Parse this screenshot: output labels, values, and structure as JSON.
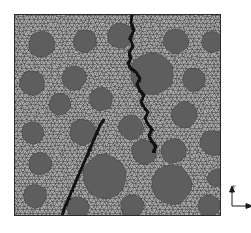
{
  "figure": {
    "panel": {
      "x": 14,
      "y": 14,
      "width": 207,
      "height": 202
    },
    "background_color": "#ffffff"
  },
  "mesh": {
    "name": "triangular-finite-element-mesh",
    "matrix_fill": "#a7a7a7",
    "mesh_line_color": "#3a3a3a",
    "mesh_line_width": 0.45,
    "cell_size": 4.3,
    "border_color": "#2b2b2b",
    "border_width": 1.0
  },
  "inclusions": {
    "name": "aggregate-inclusions",
    "fill": "#5e5e5e",
    "stroke": "#3a3a3a",
    "stroke_width": 0.5,
    "count": 26,
    "items": [
      {
        "cx": 42,
        "cy": 44,
        "r": 13.5,
        "sides": 13
      },
      {
        "cx": 85,
        "cy": 41,
        "r": 11.5,
        "sides": 12
      },
      {
        "cx": 120,
        "cy": 36,
        "r": 13.0,
        "sides": 13
      },
      {
        "cx": 176,
        "cy": 41,
        "r": 12.5,
        "sides": 13
      },
      {
        "cx": 212,
        "cy": 42,
        "r": 11.0,
        "sides": 12
      },
      {
        "cx": 32,
        "cy": 83,
        "r": 12.5,
        "sides": 13
      },
      {
        "cx": 74,
        "cy": 78,
        "r": 12.5,
        "sides": 13
      },
      {
        "cx": 152,
        "cy": 74,
        "r": 22.0,
        "sides": 15
      },
      {
        "cx": 194,
        "cy": 80,
        "r": 12.0,
        "sides": 12
      },
      {
        "cx": 60,
        "cy": 104,
        "r": 11.0,
        "sides": 12
      },
      {
        "cx": 101,
        "cy": 99,
        "r": 12.0,
        "sides": 12
      },
      {
        "cx": 184,
        "cy": 115,
        "r": 13.0,
        "sides": 13
      },
      {
        "cx": 33,
        "cy": 133,
        "r": 11.5,
        "sides": 12
      },
      {
        "cx": 83,
        "cy": 132,
        "r": 13.0,
        "sides": 13
      },
      {
        "cx": 131,
        "cy": 127,
        "r": 12.5,
        "sides": 13
      },
      {
        "cx": 213,
        "cy": 143,
        "r": 13.0,
        "sides": 13
      },
      {
        "cx": 144,
        "cy": 152,
        "r": 12.5,
        "sides": 12
      },
      {
        "cx": 174,
        "cy": 151,
        "r": 12.5,
        "sides": 12
      },
      {
        "cx": 40,
        "cy": 164,
        "r": 11.5,
        "sides": 12
      },
      {
        "cx": 104,
        "cy": 176,
        "r": 22.0,
        "sides": 15
      },
      {
        "cx": 172,
        "cy": 185,
        "r": 20.0,
        "sides": 14
      },
      {
        "cx": 35,
        "cy": 196,
        "r": 12.0,
        "sides": 12
      },
      {
        "cx": 78,
        "cy": 208,
        "r": 11.5,
        "sides": 12
      },
      {
        "cx": 132,
        "cy": 206,
        "r": 11.5,
        "sides": 12
      },
      {
        "cx": 209,
        "cy": 206,
        "r": 11.5,
        "sides": 12
      },
      {
        "cx": 216,
        "cy": 178,
        "r": 9.0,
        "sides": 11
      }
    ]
  },
  "cracks": {
    "name": "crack-paths",
    "color": "#121212",
    "width": 2.6,
    "paths": [
      {
        "label": "upper-crack-path",
        "points": [
          [
            132,
            14
          ],
          [
            131,
            22
          ],
          [
            134,
            30
          ],
          [
            130,
            38
          ],
          [
            133,
            46
          ],
          [
            129,
            52
          ],
          [
            131,
            58
          ],
          [
            128,
            63
          ],
          [
            131,
            68
          ],
          [
            136,
            72
          ],
          [
            140,
            78
          ],
          [
            137,
            84
          ],
          [
            140,
            90
          ],
          [
            144,
            95
          ],
          [
            141,
            101
          ],
          [
            144,
            107
          ],
          [
            148,
            112
          ],
          [
            145,
            118
          ],
          [
            148,
            124
          ],
          [
            152,
            129
          ],
          [
            149,
            135
          ],
          [
            152,
            141
          ],
          [
            156,
            146
          ],
          [
            153,
            152
          ]
        ]
      },
      {
        "label": "lower-crack-path",
        "points": [
          [
            104,
            119
          ],
          [
            100,
            125
          ],
          [
            97,
            132
          ],
          [
            94,
            139
          ],
          [
            91,
            146
          ],
          [
            88,
            153
          ],
          [
            85,
            160
          ],
          [
            82,
            167
          ],
          [
            79,
            174
          ],
          [
            76,
            181
          ],
          [
            73,
            188
          ],
          [
            70,
            195
          ],
          [
            67,
            202
          ],
          [
            64,
            209
          ],
          [
            62,
            216
          ]
        ]
      }
    ]
  },
  "axis_indicator": {
    "name": "coordinate-axis-indicator",
    "position": {
      "left": 224,
      "top": 184
    },
    "y_label": "y",
    "x_label": "x",
    "color": "#1a1a1a"
  }
}
